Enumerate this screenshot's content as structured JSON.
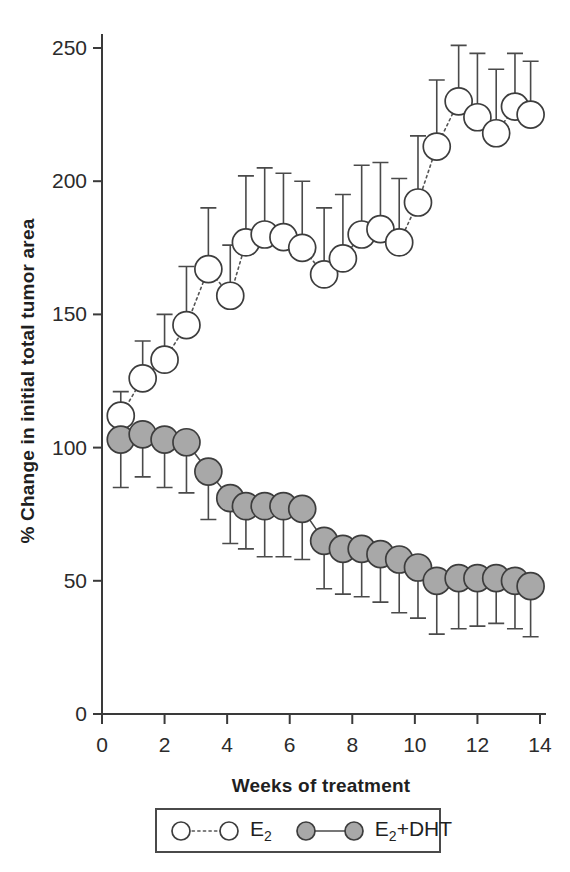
{
  "chart_data": {
    "type": "line",
    "title": "",
    "xlabel": "Weeks of treatment",
    "ylabel": "% Change in initial total tumor area",
    "xlim": [
      0,
      14
    ],
    "ylim": [
      0,
      250
    ],
    "xticks": [
      0,
      2,
      4,
      6,
      8,
      10,
      12,
      14
    ],
    "yticks": [
      0,
      50,
      100,
      150,
      200,
      250
    ],
    "xtick_labels": [
      "0",
      "2",
      "4",
      "6",
      "8",
      "10",
      "12",
      "14"
    ],
    "ytick_labels": [
      "0",
      "50",
      "100",
      "150",
      "200",
      "250"
    ],
    "grid": false,
    "legend_position": "bottom",
    "error_bars": "single-sided (E2 upward, E2+DHT downward)",
    "series": [
      {
        "name": "E2",
        "label_html": "E<sub>2</sub>",
        "marker": "open-circle",
        "marker_fill": "#ffffff",
        "marker_edge": "#3d3d3d",
        "line_style": "dotted",
        "x": [
          0.6,
          1.3,
          2.0,
          2.7,
          3.4,
          4.1,
          4.6,
          5.2,
          5.8,
          6.4,
          7.1,
          7.7,
          8.3,
          8.9,
          9.5,
          10.1,
          10.7,
          11.4,
          12.0,
          12.6,
          13.2,
          13.7
        ],
        "y": [
          112,
          126,
          133,
          146,
          167,
          157,
          177,
          180,
          179,
          175,
          165,
          171,
          180,
          182,
          177,
          192,
          213,
          230,
          224,
          218,
          228,
          225
        ],
        "yerr_upper": [
          9,
          14,
          17,
          22,
          23,
          19,
          25,
          25,
          24,
          25,
          25,
          24,
          26,
          25,
          24,
          25,
          25,
          21,
          24,
          24,
          20,
          20
        ]
      },
      {
        "name": "E2+DHT",
        "label_html": "E<sub>2</sub>+DHT",
        "marker": "filled-circle",
        "marker_fill": "#a8a8a8",
        "marker_edge": "#3d3d3d",
        "line_style": "solid",
        "x": [
          0.6,
          1.3,
          2.0,
          2.7,
          3.4,
          4.1,
          4.6,
          5.2,
          5.8,
          6.4,
          7.1,
          7.7,
          8.3,
          8.9,
          9.5,
          10.1,
          10.7,
          11.4,
          12.0,
          12.6,
          13.2,
          13.7
        ],
        "y": [
          103,
          105,
          103,
          102,
          91,
          81,
          78,
          78,
          78,
          77,
          65,
          62,
          62,
          60,
          58,
          55,
          50,
          51,
          51,
          51,
          50,
          48
        ],
        "yerr_lower": [
          18,
          16,
          18,
          19,
          18,
          17,
          16,
          19,
          19,
          19,
          18,
          17,
          18,
          18,
          20,
          19,
          20,
          19,
          18,
          17,
          18,
          19
        ]
      }
    ]
  },
  "legend": {
    "entries": [
      {
        "label": "E2",
        "label_html": "E<sub>2</sub>",
        "marker": "open-circle",
        "line": "dotted"
      },
      {
        "label": "E2+DHT",
        "label_html": "E<sub>2</sub>+DHT",
        "marker": "filled-circle",
        "line": "solid"
      }
    ]
  },
  "colors": {
    "axis": "#3a3a3a",
    "marker_open_fill": "#ffffff",
    "marker_filled_fill": "#a8a8a8",
    "marker_edge": "#3d3d3d",
    "error_bar": "#4a4a4a",
    "background": "#ffffff"
  }
}
